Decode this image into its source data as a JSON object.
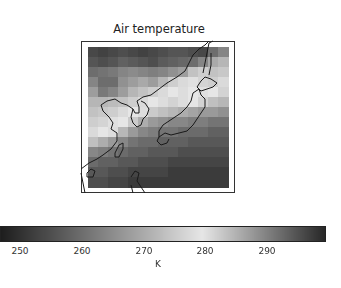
{
  "chart_data": {
    "type": "heatmap",
    "title": "Air temperature",
    "region": "East Asia (China coast, Korea, Japan, Taiwan)",
    "colormap": "grayscale diverging: dark (cold) -> light (~278 K) -> dark (warm)",
    "colorbar": {
      "orientation": "horizontal",
      "label": "K",
      "range": [
        245,
        298
      ],
      "ticks": [
        250,
        260,
        270,
        280,
        290
      ],
      "tick_labels": [
        "250",
        "260",
        "270",
        "280",
        "290"
      ]
    },
    "grid_description": "North: cold dark band ~252-260 K; central land/Japan ~272-280 K; south ocean warm ~290-296 K",
    "grid_rows": [
      [
        252,
        251,
        252,
        253,
        252,
        251,
        252,
        253,
        254,
        254,
        253,
        252,
        258,
        262
      ],
      [
        254,
        253,
        254,
        256,
        255,
        254,
        253,
        255,
        256,
        257,
        258,
        262,
        268,
        270
      ],
      [
        258,
        259,
        260,
        262,
        263,
        262,
        261,
        262,
        264,
        266,
        272,
        274,
        272,
        273
      ],
      [
        262,
        258,
        258,
        264,
        266,
        268,
        266,
        270,
        274,
        276,
        277,
        275,
        274,
        276
      ],
      [
        266,
        260,
        262,
        266,
        270,
        272,
        274,
        276,
        278,
        279,
        278,
        277,
        278,
        280
      ],
      [
        270,
        270,
        271,
        272,
        274,
        276,
        278,
        279,
        280,
        279,
        278,
        280,
        282,
        283
      ],
      [
        272,
        273,
        274,
        276,
        278,
        279,
        281,
        282,
        283,
        284,
        285,
        286,
        286,
        287
      ],
      [
        274,
        275,
        277,
        278,
        281,
        284,
        286,
        287,
        288,
        288,
        289,
        289,
        290,
        290
      ],
      [
        276,
        278,
        279,
        283,
        286,
        288,
        289,
        290,
        290,
        291,
        291,
        291,
        292,
        292
      ],
      [
        282,
        284,
        286,
        288,
        290,
        291,
        291,
        292,
        292,
        292,
        293,
        293,
        293,
        293
      ],
      [
        288,
        289,
        290,
        291,
        292,
        292,
        293,
        293,
        293,
        294,
        294,
        294,
        294,
        294
      ],
      [
        291,
        292,
        292,
        293,
        293,
        294,
        294,
        294,
        295,
        295,
        295,
        295,
        295,
        295
      ],
      [
        293,
        293,
        294,
        294,
        295,
        295,
        295,
        295,
        296,
        296,
        296,
        296,
        296,
        296
      ],
      [
        294,
        294,
        295,
        295,
        296,
        296,
        296,
        296,
        296,
        296,
        296,
        296,
        296,
        296
      ]
    ]
  },
  "title": "Air temperature",
  "colorbar": {
    "label": "K",
    "ticks": [
      "250",
      "260",
      "270",
      "280",
      "290"
    ]
  }
}
